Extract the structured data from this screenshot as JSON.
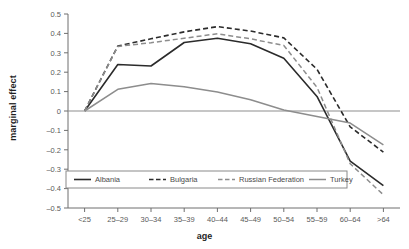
{
  "chart_data": {
    "type": "line",
    "title": "",
    "xlabel": "age",
    "ylabel": "marginal effect",
    "categories": [
      "<25",
      "25–29",
      "30–34",
      "35–39",
      "40–44",
      "45–49",
      "50–54",
      "55–59",
      "60–64",
      ">64"
    ],
    "ylim": [
      -0.5,
      0.5
    ],
    "yticks": [
      "0.5",
      "0.4",
      "0.3",
      "0.2",
      "0.1",
      "0",
      "–0.1",
      "–0.2",
      "–0.3",
      "–0.4",
      "–0.5"
    ],
    "ytick_values": [
      0.5,
      0.4,
      0.3,
      0.2,
      0.1,
      0,
      -0.1,
      -0.2,
      -0.3,
      -0.4,
      -0.5
    ],
    "grid": false,
    "zero_line": true,
    "legend_position": "inside-bottom-left",
    "series": [
      {
        "name": "Albania",
        "color": "#2b2b2b",
        "dash": "none",
        "width": 1.6,
        "values": [
          0,
          0.24,
          0.232,
          0.353,
          0.375,
          0.347,
          0.272,
          0.075,
          -0.258,
          -0.385
        ]
      },
      {
        "name": "Bulgaria",
        "color": "#2b2b2b",
        "dash": "dashed",
        "width": 1.6,
        "values": [
          0,
          0.335,
          0.372,
          0.408,
          0.435,
          0.412,
          0.377,
          0.215,
          -0.082,
          -0.212
        ]
      },
      {
        "name": "Russian Federation",
        "color": "#8d8d8d",
        "dash": "dashed",
        "width": 1.5,
        "values": [
          0,
          0.333,
          0.352,
          0.375,
          0.398,
          0.372,
          0.338,
          0.122,
          -0.272,
          -0.432
        ]
      },
      {
        "name": "Turkey",
        "color": "#8d8d8d",
        "dash": "none",
        "width": 1.5,
        "values": [
          0,
          0.112,
          0.142,
          0.125,
          0.098,
          0.058,
          0.005,
          -0.028,
          -0.062,
          -0.175
        ]
      }
    ]
  },
  "legend": {
    "entries": [
      {
        "label": "Albania"
      },
      {
        "label": "Bulgaria"
      },
      {
        "label": "Russian Federation"
      },
      {
        "label": "Turkey"
      }
    ]
  },
  "axis": {
    "x_title": "age",
    "y_title": "marginal effect"
  }
}
